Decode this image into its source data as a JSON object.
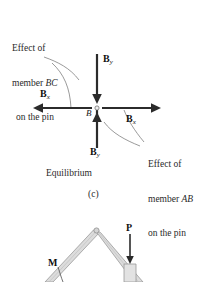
{
  "figure": {
    "panel_caption": "(c)",
    "equilibrium_label": "Equilibrium",
    "center_point_label": "B",
    "left_annotation": {
      "line1": "Effect of",
      "line2_prefix": "member ",
      "line2_members": "BC",
      "line3": "on the pin"
    },
    "right_annotation": {
      "line1": "Effect of",
      "line2_prefix": "member ",
      "line2_members": "AB",
      "line3": "on the pin"
    },
    "vectors": [
      {
        "name": "top-force",
        "symbol": "B",
        "subscript": "y",
        "direction": "down"
      },
      {
        "name": "left-force",
        "symbol": "B",
        "subscript": "x",
        "direction": "left"
      },
      {
        "name": "right-force",
        "symbol": "B",
        "subscript": "x",
        "direction": "right"
      },
      {
        "name": "bottom-force",
        "symbol": "B",
        "subscript": "y",
        "direction": "up"
      }
    ],
    "frame": {
      "load_label": "P",
      "moment_label": "M"
    },
    "colors": {
      "ink": "#1a1a1a",
      "arrow": "#2b2b2b",
      "leader": "#6b6b6b",
      "member_fill": "#d9d9d9",
      "member_edge": "#8a8a8a",
      "background": "#ffffff"
    }
  }
}
